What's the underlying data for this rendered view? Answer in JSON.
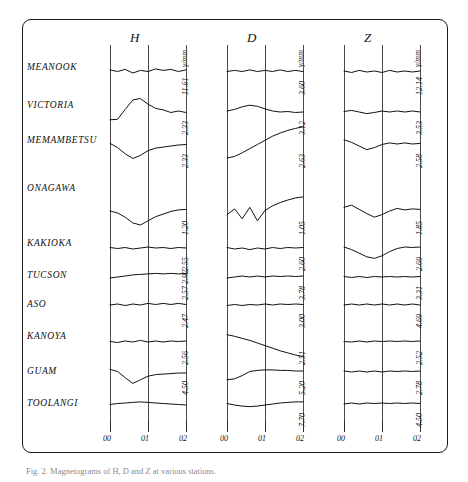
{
  "figure": {
    "caption": "Fig. 2. Magnetograms of H, D and Z at various stations.",
    "panels": [
      {
        "key": "H",
        "label": "H",
        "unit": "γ/mm",
        "x_ticks": [
          "00",
          "01",
          "02"
        ]
      },
      {
        "key": "D",
        "label": "D",
        "unit": "γ/mm",
        "x_ticks": [
          "00",
          "01",
          "02"
        ]
      },
      {
        "key": "Z",
        "label": "Z",
        "unit": "γ/mm",
        "x_ticks": [
          "00",
          "01",
          "02"
        ]
      }
    ],
    "stations": [
      "MEANOOK",
      "VICTORIA",
      "MEMAMBETSU",
      "ONAGAWA",
      "KAKIOKA",
      "TUCSON",
      "ASO",
      "KANOYA",
      "GUAM",
      "TOOLANGI"
    ]
  },
  "chart_data": {
    "type": "line",
    "title": "",
    "xlabel": "",
    "ylabel": "",
    "grid": true,
    "legend": "none",
    "x": [
      "00",
      "01",
      "02"
    ],
    "xlim": [
      0,
      2
    ],
    "panels": [
      {
        "name": "H",
        "unit": "γ/mm",
        "scale_values": [
          "11.61",
          "2.33",
          "2.33",
          "1.20",
          "2.55",
          "2.57 2.92",
          "2.47",
          "2.56",
          "4.50"
        ],
        "series": [
          {
            "name": "MEANOOK",
            "scale": "11.61",
            "values": [
              0.08,
              0.02,
              0.1,
              -0.04,
              0.06,
              0.02,
              0.12,
              0.06,
              0.1,
              0.02,
              0.08
            ]
          },
          {
            "name": "VICTORIA",
            "scale": "2.33",
            "values": [
              -0.3,
              -0.28,
              0.1,
              0.46,
              0.52,
              0.3,
              0.14,
              0.08,
              -0.02,
              0.04,
              -0.02
            ]
          },
          {
            "name": "MEMAMBETSU",
            "scale": "2.33",
            "values": [
              0.06,
              -0.1,
              -0.34,
              -0.52,
              -0.4,
              -0.22,
              -0.12,
              -0.08,
              -0.04,
              0.0,
              0.02
            ]
          },
          {
            "name": "ONAGAWA",
            "scale": "1.20",
            "values": [
              0.04,
              -0.04,
              -0.2,
              -0.42,
              -0.5,
              -0.34,
              -0.18,
              -0.08,
              0.02,
              0.08,
              0.1
            ]
          },
          {
            "name": "KAKIOKA",
            "scale": "2.55",
            "values": [
              0.02,
              -0.02,
              0.02,
              -0.04,
              0.0,
              0.04,
              0.0,
              0.02,
              -0.02,
              0.02,
              0.0
            ]
          },
          {
            "name": "TUCSON",
            "scale": "2.57 2.92",
            "values": [
              -0.04,
              0.0,
              0.04,
              0.08,
              0.1,
              0.12,
              0.14,
              0.12,
              0.14,
              0.12,
              0.14
            ]
          },
          {
            "name": "ASO",
            "scale": "2.47",
            "values": [
              0.0,
              0.04,
              -0.02,
              0.04,
              0.0,
              0.06,
              0.02,
              0.06,
              0.02,
              0.06,
              0.02
            ]
          },
          {
            "name": "KANOYA",
            "scale": "2.56",
            "values": [
              0.02,
              -0.02,
              0.04,
              0.0,
              0.06,
              0.0,
              0.04,
              0.0,
              0.04,
              0.02,
              0.04
            ]
          },
          {
            "name": "GUAM",
            "scale": "4.50",
            "values": [
              0.1,
              0.02,
              -0.22,
              -0.44,
              -0.3,
              -0.16,
              -0.1,
              -0.08,
              -0.06,
              -0.04,
              -0.04
            ]
          },
          {
            "name": "TOOLANGI",
            "scale": "",
            "values": [
              -0.02,
              0.02,
              0.04,
              0.06,
              0.08,
              0.06,
              0.04,
              0.02,
              0.0,
              -0.02,
              -0.04
            ]
          }
        ]
      },
      {
        "name": "D",
        "unit": "γ/mm",
        "scale_values": [
          "3.60",
          "3.12",
          "2.63",
          "1.05",
          "2.60",
          "3.78",
          "3.00",
          "2.51",
          "5.20",
          "7.70"
        ],
        "series": [
          {
            "name": "MEANOOK",
            "scale": "3.60",
            "values": [
              0.02,
              0.06,
              0.02,
              0.08,
              0.02,
              0.06,
              0.02,
              0.08,
              0.02,
              0.06,
              0.02
            ]
          },
          {
            "name": "VICTORIA",
            "scale": "3.12",
            "values": [
              0.04,
              0.1,
              0.2,
              0.26,
              0.22,
              0.12,
              0.04,
              0.0,
              0.02,
              -0.02,
              0.0
            ]
          },
          {
            "name": "MEMAMBETSU",
            "scale": "2.63",
            "values": [
              -0.5,
              -0.44,
              -0.3,
              -0.14,
              0.02,
              0.18,
              0.34,
              0.46,
              0.56,
              0.64,
              0.7
            ]
          },
          {
            "name": "ONAGAWA",
            "scale": "1.05",
            "values": [
              -0.1,
              0.12,
              -0.26,
              0.18,
              -0.34,
              0.06,
              0.24,
              0.36,
              0.46,
              0.54,
              0.58
            ]
          },
          {
            "name": "KAKIOKA",
            "scale": "2.60",
            "values": [
              0.02,
              -0.04,
              0.0,
              -0.06,
              0.0,
              -0.04,
              0.02,
              -0.02,
              0.02,
              0.0,
              0.02
            ]
          },
          {
            "name": "TUCSON",
            "scale": "3.78",
            "values": [
              -0.04,
              0.0,
              0.04,
              0.0,
              0.04,
              0.0,
              0.04,
              0.02,
              0.04,
              0.02,
              0.04
            ]
          },
          {
            "name": "ASO",
            "scale": "3.00",
            "values": [
              -0.02,
              0.02,
              -0.02,
              0.02,
              0.0,
              0.04,
              0.0,
              0.04,
              0.02,
              0.04,
              0.02
            ]
          },
          {
            "name": "KANOYA",
            "scale": "2.51",
            "values": [
              0.28,
              0.22,
              0.14,
              0.06,
              -0.04,
              -0.14,
              -0.24,
              -0.34,
              -0.42,
              -0.5,
              -0.56
            ]
          },
          {
            "name": "GUAM",
            "scale": "5.20",
            "values": [
              -0.3,
              -0.26,
              -0.14,
              0.02,
              0.06,
              0.08,
              0.08,
              0.06,
              0.06,
              0.04,
              0.04
            ]
          },
          {
            "name": "TOOLANGI",
            "scale": "7.70",
            "values": [
              0.02,
              -0.04,
              -0.08,
              -0.1,
              -0.08,
              -0.04,
              0.0,
              0.04,
              0.06,
              0.08,
              0.08
            ]
          }
        ]
      },
      {
        "name": "Z",
        "unit": "γ/mm",
        "scale_values": [
          "12.14",
          "3.53",
          "2.58",
          "1.85",
          "2.69",
          "3.31",
          "4.69",
          "2.52",
          "2.78",
          "4.50"
        ],
        "series": [
          {
            "name": "MEANOOK",
            "scale": "12.14",
            "values": [
              0.04,
              -0.02,
              0.06,
              0.0,
              0.04,
              -0.02,
              0.06,
              0.0,
              0.04,
              0.0,
              0.04
            ]
          },
          {
            "name": "VICTORIA",
            "scale": "3.53",
            "values": [
              0.02,
              0.06,
              0.0,
              -0.06,
              -0.02,
              0.04,
              0.0,
              0.04,
              0.0,
              0.04,
              0.0
            ]
          },
          {
            "name": "MEMAMBETSU",
            "scale": "2.58",
            "values": [
              0.2,
              0.1,
              -0.04,
              -0.18,
              -0.1,
              0.02,
              0.08,
              0.04,
              0.08,
              0.04,
              0.06
            ]
          },
          {
            "name": "ONAGAWA",
            "scale": "1.85",
            "values": [
              0.18,
              0.26,
              0.1,
              -0.06,
              -0.2,
              -0.1,
              0.04,
              0.14,
              0.08,
              0.12,
              0.1
            ]
          },
          {
            "name": "KAKIOKA",
            "scale": "2.69",
            "values": [
              0.04,
              -0.06,
              -0.2,
              -0.34,
              -0.4,
              -0.3,
              -0.14,
              -0.02,
              0.04,
              0.02,
              0.04
            ]
          },
          {
            "name": "TUCSON",
            "scale": "3.31",
            "values": [
              0.02,
              -0.02,
              0.02,
              -0.02,
              0.02,
              0.0,
              0.02,
              0.0,
              0.02,
              0.0,
              0.02
            ]
          },
          {
            "name": "ASO",
            "scale": "4.69",
            "values": [
              0.0,
              0.04,
              0.0,
              0.04,
              0.0,
              0.04,
              0.0,
              0.04,
              0.0,
              0.04,
              0.0
            ]
          },
          {
            "name": "KANOYA",
            "scale": "2.52",
            "values": [
              0.02,
              0.0,
              0.04,
              0.0,
              0.04,
              0.02,
              0.04,
              0.02,
              0.04,
              0.02,
              0.04
            ]
          },
          {
            "name": "GUAM",
            "scale": "2.78",
            "values": [
              0.04,
              0.0,
              0.04,
              0.0,
              0.04,
              0.0,
              0.04,
              0.02,
              0.04,
              0.02,
              0.04
            ]
          },
          {
            "name": "TOOLANGI",
            "scale": "4.50",
            "values": [
              0.0,
              0.04,
              0.0,
              0.04,
              0.02,
              0.04,
              0.02,
              0.04,
              0.02,
              0.04,
              0.02
            ]
          }
        ]
      }
    ]
  }
}
